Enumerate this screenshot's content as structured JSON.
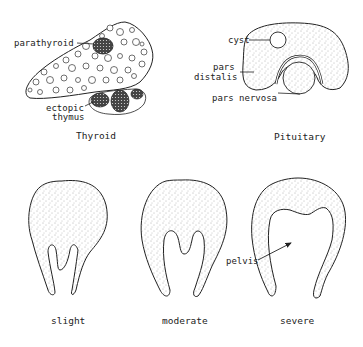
{
  "panels": {
    "thyroid": {
      "caption": "Thyroid",
      "labels": {
        "parathyroid": "parathyroid",
        "ectopic_line1": "ectopic",
        "ectopic_line2": "thymus"
      }
    },
    "pituitary": {
      "caption": "Pituitary",
      "labels": {
        "cyst": "cyst",
        "pars_distalis_line1": "pars",
        "pars_distalis_line2": "distalis",
        "pars_nervosa": "pars nervosa"
      }
    },
    "kidneys": {
      "items": [
        {
          "caption": "slight"
        },
        {
          "caption": "moderate"
        },
        {
          "caption": "severe"
        }
      ],
      "pelvis_label": "pelvis"
    }
  },
  "colors": {
    "ink": "#222222",
    "stipple": "#555555",
    "background": "#ffffff"
  }
}
